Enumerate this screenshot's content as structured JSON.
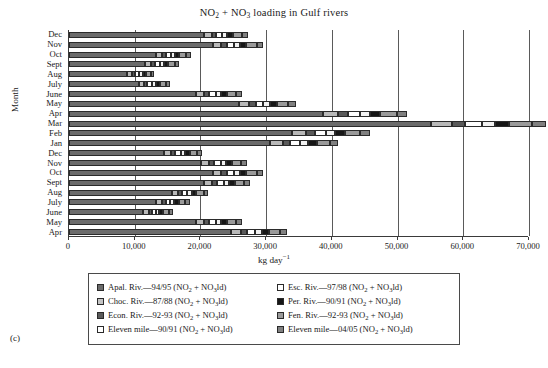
{
  "panel_tag": "(c)",
  "chart_data": {
    "type": "bar",
    "orientation": "horizontal",
    "stacked": true,
    "title": "NO2 + NO3 loading in Gulf rivers",
    "title_parts": {
      "a": "NO",
      "sub_a": "2",
      "mid": " + NO",
      "sub_b": "3",
      "tail": " loading in Gulf rivers"
    },
    "xlabel": "kg day-1",
    "xlabel_parts": {
      "text": "kg day",
      "sup": "−1"
    },
    "ylabel": "Month",
    "xlim": [
      0,
      70000
    ],
    "xticks": [
      0,
      10000,
      20000,
      30000,
      40000,
      50000,
      60000,
      70000
    ],
    "xtick_labels": [
      "0",
      "10,000",
      "20,000",
      "30,000",
      "40,000",
      "50,000",
      "60,000",
      "70,000"
    ],
    "grid": "vertical",
    "legend_position": "below-plot",
    "categories": [
      "Dec",
      "Nov",
      "Oct",
      "Sept",
      "Aug",
      "July",
      "June",
      "May",
      "Apr",
      "Mar",
      "Feb",
      "Jan",
      "Dec",
      "Nov",
      "Oct",
      "Sept",
      "Aug",
      "July",
      "June",
      "May",
      "Apr"
    ],
    "series": [
      {
        "name": "Apal. Riv.-94/95",
        "color": "#6b6b6b",
        "values": [
          20600,
          21900,
          13200,
          11600,
          8900,
          10600,
          19300,
          25900,
          38700,
          55100,
          33900,
          30600,
          14500,
          20100,
          21900,
          20600,
          15600,
          13200,
          11300,
          19300,
          24600
        ]
      },
      {
        "name": "Choc. Riv.-87/88",
        "color": "#b8b8b8",
        "values": [
          1100,
          1300,
          900,
          900,
          700,
          800,
          1200,
          1500,
          2300,
          3200,
          2100,
          1900,
          1000,
          1200,
          1300,
          1200,
          1000,
          900,
          800,
          1200,
          1500
        ]
      },
      {
        "name": "Econ. Riv.-92-93",
        "color": "#5a5a5a",
        "values": [
          700,
          800,
          600,
          600,
          500,
          500,
          800,
          1000,
          1500,
          2000,
          1400,
          1200,
          700,
          800,
          800,
          800,
          600,
          600,
          500,
          800,
          1000
        ]
      },
      {
        "name": "Eleven mile-90/91",
        "color": "#ffffff",
        "values": [
          900,
          1100,
          800,
          700,
          600,
          700,
          1000,
          1200,
          1800,
          2500,
          1700,
          1500,
          800,
          1000,
          1100,
          1000,
          800,
          700,
          600,
          1000,
          1200
        ]
      },
      {
        "name": "Esc. Riv.-97/98",
        "color": "#f2f2f2",
        "values": [
          800,
          900,
          600,
          600,
          500,
          600,
          800,
          1000,
          1500,
          2000,
          1400,
          1200,
          700,
          800,
          900,
          800,
          700,
          600,
          500,
          800,
          1000
        ]
      },
      {
        "name": "Per. Riv.-90/91",
        "color": "#161616",
        "values": [
          900,
          1000,
          700,
          700,
          500,
          600,
          900,
          1100,
          1600,
          2200,
          1500,
          1300,
          700,
          900,
          1000,
          900,
          700,
          700,
          600,
          900,
          1100
        ]
      },
      {
        "name": "Fen. Riv.-92-93",
        "color": "#9a9a9a",
        "values": [
          1400,
          1600,
          1000,
          1000,
          800,
          900,
          1400,
          1700,
          2500,
          3400,
          2300,
          2000,
          1100,
          1400,
          1600,
          1400,
          1100,
          1000,
          900,
          1400,
          1700
        ]
      },
      {
        "name": "Eleven mile-04/05",
        "color": "#808080",
        "values": [
          900,
          1000,
          700,
          700,
          500,
          600,
          900,
          1100,
          1600,
          2200,
          1500,
          1300,
          700,
          900,
          1000,
          900,
          700,
          700,
          600,
          900,
          1100
        ]
      }
    ]
  },
  "legend": {
    "entries": [
      {
        "label": "Apal. Riv.—94/95 (NO",
        "sub1": "2",
        "mid": " + NO",
        "sub2": "3",
        "tail": "ld)",
        "color": "#6b6b6b",
        "col": 0
      },
      {
        "label": "Esc. Riv.—97/98 (NO",
        "sub1": "2",
        "mid": " + NO",
        "sub2": "3",
        "tail": "ld)",
        "color": "#ffffff",
        "col": 1
      },
      {
        "label": "Choc. Riv.—87/88 (NO",
        "sub1": "2",
        "mid": " + NO",
        "sub2": "3",
        "tail": "ld)",
        "color": "#c4c4c4",
        "col": 0
      },
      {
        "label": "Per. Riv.—90/91 (NO",
        "sub1": "2",
        "mid": " + NO",
        "sub2": "3",
        "tail": "ld)",
        "color": "#161616",
        "col": 1
      },
      {
        "label": "Econ. Riv.—92-93 (NO",
        "sub1": "2",
        "mid": " + NO",
        "sub2": "3",
        "tail": "ld)",
        "color": "#5a5a5a",
        "col": 0
      },
      {
        "label": "Fen. Riv.—92-93 (NO",
        "sub1": "2",
        "mid": " + NO",
        "sub2": "3",
        "tail": "ld)",
        "color": "#9a9a9a",
        "col": 1
      },
      {
        "label": "Eleven mile—90/91 (NO",
        "sub1": "2",
        "mid": " + NO",
        "sub2": "3",
        "tail": "ld)",
        "color": "#ffffff",
        "col": 0
      },
      {
        "label": "Eleven mile—04/05 (NO",
        "sub1": "2",
        "mid": " + NO",
        "sub2": "3",
        "tail": "ld)",
        "color": "#808080",
        "col": 1
      }
    ],
    "order_display": [
      0,
      1,
      2,
      3,
      4,
      5,
      6,
      7
    ]
  }
}
